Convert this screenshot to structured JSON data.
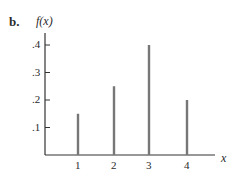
{
  "part_label": "b.",
  "chart_data": {
    "type": "bar",
    "title": "",
    "xlabel": "x",
    "ylabel": "f(x)",
    "categories": [
      "1",
      "2",
      "3",
      "4"
    ],
    "x": [
      1,
      2,
      3,
      4
    ],
    "values": [
      0.15,
      0.25,
      0.4,
      0.2
    ],
    "ylim": [
      0,
      0.4
    ],
    "yticks": [
      ".1",
      ".2",
      ".3",
      ".4"
    ],
    "xticks": [
      "1",
      "2",
      "3",
      "4"
    ],
    "grid": false,
    "legend": null,
    "style": "vertical-line probability mass function"
  },
  "colors": {
    "bar": "#777777",
    "axis": "#333333",
    "text": "#2a2a2a"
  }
}
